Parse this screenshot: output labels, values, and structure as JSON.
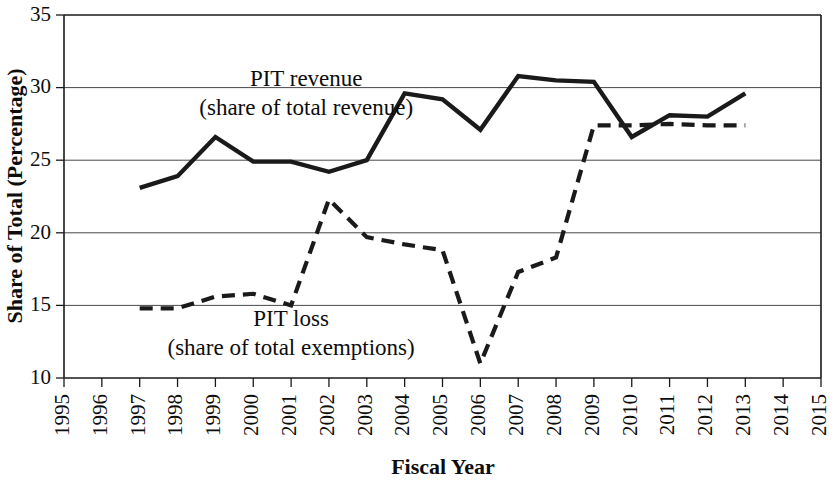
{
  "chart_data": {
    "type": "line",
    "title": "",
    "xlabel": "Fiscal Year",
    "ylabel": "Share of Total (Percentage)",
    "xlim": [
      1995,
      2015
    ],
    "ylim": [
      10,
      35
    ],
    "xticks": [
      "1995",
      "1996",
      "1997",
      "1998",
      "1999",
      "2000",
      "2001",
      "2002",
      "2003",
      "2004",
      "2005",
      "2006",
      "2007",
      "2008",
      "2009",
      "2010",
      "2011",
      "2012",
      "2013",
      "2014",
      "2015"
    ],
    "yticks": [
      "10",
      "15",
      "20",
      "25",
      "30",
      "35"
    ],
    "grid": "horizontal",
    "legend": "inline-annotations",
    "x": [
      1997,
      1998,
      1999,
      2000,
      2001,
      2002,
      2003,
      2004,
      2005,
      2006,
      2007,
      2008,
      2009,
      2010,
      2011,
      2012,
      2013
    ],
    "series": [
      {
        "name": "PIT revenue (share of total revenue)",
        "style": "solid",
        "color": "#1a1a1a",
        "values": [
          23.1,
          23.9,
          26.6,
          24.9,
          24.9,
          24.2,
          25.0,
          29.6,
          29.2,
          27.1,
          30.8,
          30.5,
          30.4,
          26.6,
          28.1,
          28.0,
          29.6
        ]
      },
      {
        "name": "PIT loss (share of total exemptions)",
        "style": "dashed",
        "color": "#1a1a1a",
        "values": [
          14.8,
          14.8,
          15.6,
          15.8,
          15.0,
          22.3,
          19.7,
          19.2,
          18.8,
          11.0,
          17.3,
          18.3,
          27.4,
          27.4,
          27.5,
          27.4,
          27.4
        ]
      }
    ],
    "annotations": [
      {
        "id": "pit-revenue-label",
        "lines": [
          "PIT revenue",
          "(share of total revenue)"
        ],
        "x": 2001.4,
        "y": 30.1
      },
      {
        "id": "pit-loss-label",
        "lines": [
          "PIT loss",
          "(share of total exemptions)"
        ],
        "x": 2001.0,
        "y": 13.6
      }
    ]
  }
}
